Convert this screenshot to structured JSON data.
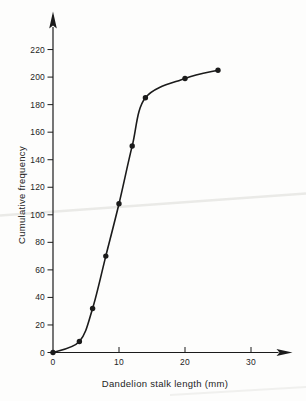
{
  "page": {
    "background": "#fdfdfc",
    "ink_color": "#1b1b1b",
    "text_color": "#242424",
    "artifact_color": "#eaeae7"
  },
  "chart_data": {
    "type": "line",
    "title": "",
    "xlabel": "Dandelion stalk length (mm)",
    "ylabel": "Cumulative frequency",
    "series": [
      {
        "name": "cumulative-frequency-ogive",
        "x": [
          0,
          4,
          6,
          8,
          10,
          12,
          14,
          20,
          25
        ],
        "y": [
          0,
          8,
          32,
          70,
          108,
          150,
          185,
          199,
          205
        ]
      }
    ],
    "x_ticks": [
      0,
      10,
      20,
      30
    ],
    "y_ticks": [
      0,
      20,
      40,
      60,
      80,
      100,
      120,
      140,
      160,
      180,
      200,
      220
    ],
    "xlim": [
      0,
      33
    ],
    "ylim": [
      0,
      235
    ],
    "grid": false,
    "legend_position": "none",
    "marker": "filled-circle",
    "line_color": "#1b1b1b",
    "axis_arrows": true
  }
}
